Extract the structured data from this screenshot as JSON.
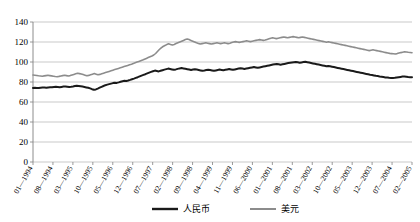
{
  "chart_data": {
    "type": "line",
    "title": "",
    "subtitle": "",
    "xlabel": "",
    "ylabel": "",
    "ylim": [
      0,
      140
    ],
    "ytick_step": 20,
    "yticks": [
      "0",
      "20",
      "40",
      "60",
      "80",
      "100",
      "120",
      "140"
    ],
    "grid": true,
    "legend_position": "bottom",
    "xtick_labels": [
      "01—1994",
      "08—1994",
      "03—1995",
      "10—1995",
      "05—1996",
      "12—1996",
      "07—1997",
      "02—1998",
      "09—1998",
      "04—1999",
      "11—1999",
      "06—2000",
      "01—2001",
      "08—2001",
      "03—2002",
      "10—2002",
      "05—2003",
      "12—2003",
      "07—2004",
      "02—2005"
    ],
    "x_start": "01—1994",
    "x_end": "02—2005",
    "series": [
      {
        "name": "人民币",
        "color": "#1a1a1a",
        "width": 2.0,
        "values": [
          74.0,
          74.2,
          74.1,
          73.9,
          74.3,
          74.5,
          74.4,
          74.2,
          74.6,
          74.8,
          74.7,
          75.0,
          75.2,
          75.0,
          74.8,
          75.1,
          75.4,
          75.6,
          75.3,
          75.0,
          75.2,
          75.5,
          75.9,
          76.2,
          76.0,
          75.7,
          75.4,
          75.0,
          74.6,
          74.2,
          73.6,
          72.8,
          72.2,
          72.6,
          73.4,
          74.3,
          75.2,
          76.0,
          76.8,
          77.4,
          77.9,
          78.4,
          78.9,
          79.3,
          79.1,
          79.6,
          80.2,
          80.8,
          81.2,
          81.0,
          81.5,
          82.1,
          82.8,
          83.4,
          84.1,
          84.8,
          85.6,
          86.4,
          87.1,
          87.8,
          88.6,
          89.4,
          90.1,
          90.8,
          91.4,
          91.0,
          90.6,
          91.2,
          91.8,
          92.4,
          92.9,
          93.4,
          93.0,
          92.6,
          92.2,
          92.6,
          93.1,
          93.6,
          94.0,
          93.6,
          93.2,
          92.8,
          92.4,
          92.0,
          92.4,
          92.8,
          92.4,
          92.0,
          91.6,
          91.2,
          91.5,
          91.9,
          92.3,
          92.0,
          91.6,
          91.2,
          91.6,
          92.0,
          92.4,
          92.1,
          91.8,
          92.2,
          92.6,
          93.0,
          92.6,
          92.2,
          92.6,
          93.0,
          93.4,
          93.8,
          93.4,
          93.0,
          93.4,
          93.8,
          94.2,
          94.6,
          95.0,
          94.6,
          94.2,
          94.6,
          95.0,
          95.4,
          95.8,
          96.2,
          96.6,
          97.0,
          97.4,
          97.8,
          98.1,
          97.7,
          97.3,
          97.7,
          98.1,
          98.5,
          98.9,
          99.2,
          99.5,
          99.8,
          100.1,
          99.7,
          99.3,
          99.6,
          99.9,
          100.2,
          99.8,
          99.4,
          99.0,
          98.6,
          98.2,
          97.8,
          97.4,
          97.0,
          96.6,
          96.2,
          95.8,
          96.1,
          95.7,
          95.3,
          94.9,
          94.5,
          94.1,
          93.7,
          93.3,
          92.9,
          92.5,
          92.1,
          91.7,
          91.3,
          90.9,
          90.5,
          90.1,
          89.7,
          89.3,
          88.9,
          88.5,
          88.1,
          87.7,
          87.3,
          87.0,
          86.6,
          86.2,
          85.9,
          85.5,
          85.2,
          84.9,
          84.6,
          84.4,
          84.2,
          84.1,
          84.0,
          84.2,
          84.5,
          84.8,
          85.1,
          85.4,
          85.6,
          85.3,
          85.0,
          84.8,
          84.7
        ]
      },
      {
        "name": "美元",
        "color": "#8c8c8c",
        "width": 1.6,
        "values": [
          87.0,
          86.8,
          86.5,
          86.2,
          86.0,
          85.8,
          86.1,
          86.4,
          86.7,
          86.4,
          86.1,
          85.8,
          85.5,
          85.3,
          85.6,
          86.0,
          86.4,
          86.8,
          86.4,
          86.0,
          86.4,
          87.0,
          87.6,
          88.2,
          88.8,
          88.4,
          88.0,
          87.4,
          86.8,
          86.2,
          86.6,
          87.2,
          87.8,
          88.4,
          87.8,
          87.2,
          87.6,
          88.2,
          88.8,
          89.4,
          90.0,
          90.6,
          91.2,
          91.8,
          92.4,
          93.0,
          93.6,
          94.2,
          94.8,
          95.4,
          96.0,
          96.6,
          97.2,
          97.8,
          98.5,
          99.2,
          99.9,
          100.6,
          101.3,
          102.0,
          102.8,
          103.6,
          104.4,
          105.2,
          106.0,
          107.0,
          108.5,
          110.5,
          112.5,
          114.2,
          115.5,
          116.5,
          117.4,
          118.2,
          117.6,
          117.0,
          117.6,
          118.4,
          119.2,
          120.0,
          120.8,
          121.6,
          122.4,
          123.0,
          122.4,
          121.6,
          120.8,
          120.0,
          119.2,
          118.6,
          118.0,
          118.4,
          118.8,
          119.2,
          118.8,
          118.4,
          118.0,
          118.4,
          118.8,
          119.2,
          118.8,
          118.4,
          118.8,
          119.2,
          118.8,
          118.4,
          118.8,
          119.4,
          120.0,
          120.4,
          120.0,
          119.6,
          120.0,
          120.4,
          120.8,
          121.2,
          120.8,
          120.4,
          120.8,
          121.2,
          121.6,
          122.0,
          122.4,
          122.0,
          121.6,
          122.0,
          122.6,
          123.2,
          123.8,
          124.2,
          123.8,
          123.4,
          123.8,
          124.2,
          124.6,
          125.0,
          124.6,
          124.2,
          124.6,
          125.0,
          125.4,
          125.0,
          124.6,
          124.2,
          124.6,
          125.0,
          124.6,
          124.2,
          123.8,
          123.4,
          123.0,
          122.6,
          122.2,
          121.8,
          121.4,
          121.0,
          120.6,
          120.2,
          119.8,
          120.2,
          119.8,
          119.4,
          119.0,
          118.6,
          118.2,
          117.8,
          117.4,
          117.0,
          116.6,
          116.2,
          115.8,
          115.4,
          115.0,
          114.6,
          114.2,
          113.8,
          113.4,
          113.0,
          112.6,
          112.2,
          111.8,
          111.4,
          111.8,
          112.2,
          111.8,
          111.4,
          111.0,
          110.6,
          110.2,
          109.8,
          109.4,
          109.0,
          108.6,
          108.4,
          108.2,
          108.0,
          108.4,
          108.9,
          109.4,
          109.8,
          110.2,
          110.0,
          109.7,
          109.5,
          109.3
        ]
      }
    ]
  }
}
